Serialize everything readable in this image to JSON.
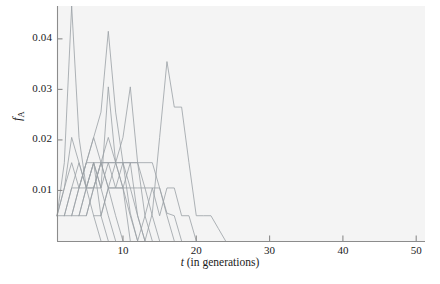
{
  "figure": {
    "width": 440,
    "height": 284,
    "background": "#ffffff",
    "panel_background": "#f4f4f4",
    "line_color": "#9aa0a6"
  },
  "chart_data": {
    "type": "line",
    "title": "",
    "xlabel": "t (in generations)",
    "xlabel_italic_part": "t",
    "xlabel_rest": " (in generations)",
    "ylabel": "f_A",
    "ylabel_base": "f",
    "ylabel_sub": "A",
    "xlim": [
      1,
      51.2
    ],
    "ylim": [
      0,
      0.0465
    ],
    "grid": false,
    "legend": null,
    "xticks": [
      10,
      20,
      30,
      40,
      50
    ],
    "xticklabels": [
      "10",
      "20",
      "30",
      "40",
      "50"
    ],
    "yticks": [
      0.01,
      0.02,
      0.03,
      0.04
    ],
    "yticklabels": [
      "0.01",
      "0.02",
      "0.03",
      "0.04"
    ],
    "series": [
      {
        "name": "replicate-1",
        "x": [
          1,
          2,
          3,
          4,
          5,
          6,
          7,
          8
        ],
        "values": [
          0.005,
          0.0155,
          0.0465,
          0.0205,
          0.0105,
          0.0155,
          0.005,
          0.0
        ]
      },
      {
        "name": "replicate-2",
        "x": [
          1,
          2,
          3,
          4,
          5,
          6,
          7
        ],
        "values": [
          0.005,
          0.0105,
          0.0205,
          0.0155,
          0.0105,
          0.005,
          0.0
        ]
      },
      {
        "name": "replicate-3",
        "x": [
          1,
          2,
          3,
          4,
          5,
          6,
          7,
          8,
          9
        ],
        "values": [
          0.005,
          0.005,
          0.0105,
          0.0155,
          0.0105,
          0.0155,
          0.0105,
          0.005,
          0.0
        ]
      },
      {
        "name": "replicate-4",
        "x": [
          1,
          2,
          3,
          4,
          5,
          6,
          7,
          8,
          9,
          10
        ],
        "values": [
          0.005,
          0.0105,
          0.0155,
          0.0105,
          0.0155,
          0.0205,
          0.0155,
          0.0105,
          0.005,
          0.0
        ]
      },
      {
        "name": "replicate-5",
        "x": [
          2,
          3,
          4,
          5,
          6,
          7,
          8,
          9,
          10,
          11
        ],
        "values": [
          0.005,
          0.005,
          0.0105,
          0.0105,
          0.0155,
          0.0105,
          0.0305,
          0.0155,
          0.0105,
          0.0
        ]
      },
      {
        "name": "replicate-6",
        "x": [
          2,
          3,
          4,
          5,
          6,
          7,
          8,
          9,
          10,
          11,
          12
        ],
        "values": [
          0.005,
          0.0105,
          0.0105,
          0.0155,
          0.0155,
          0.0155,
          0.0155,
          0.0155,
          0.0105,
          0.005,
          0.0
        ]
      },
      {
        "name": "replicate-7",
        "x": [
          3,
          4,
          5,
          6,
          7,
          8,
          9,
          10,
          11,
          12
        ],
        "values": [
          0.005,
          0.0105,
          0.0155,
          0.0205,
          0.0255,
          0.0415,
          0.0255,
          0.0155,
          0.0055,
          0.0
        ]
      },
      {
        "name": "replicate-8",
        "x": [
          3,
          4,
          5,
          6,
          7,
          8,
          9,
          10,
          11,
          12,
          13
        ],
        "values": [
          0.005,
          0.005,
          0.0105,
          0.0105,
          0.0155,
          0.0205,
          0.0155,
          0.0155,
          0.0105,
          0.005,
          0.0
        ]
      },
      {
        "name": "replicate-9",
        "x": [
          4,
          5,
          6,
          7,
          8,
          9,
          10,
          11,
          12,
          13
        ],
        "values": [
          0.005,
          0.0105,
          0.0105,
          0.0155,
          0.0155,
          0.0105,
          0.0105,
          0.0155,
          0.005,
          0.0
        ]
      },
      {
        "name": "replicate-10",
        "x": [
          4,
          5,
          6,
          7,
          8,
          9,
          10,
          11,
          12,
          13,
          14
        ],
        "values": [
          0.005,
          0.005,
          0.0105,
          0.0155,
          0.0105,
          0.0155,
          0.0205,
          0.0305,
          0.0155,
          0.005,
          0.0
        ]
      },
      {
        "name": "replicate-11",
        "x": [
          5,
          6,
          7,
          8,
          9,
          10,
          11,
          12,
          13,
          14,
          15
        ],
        "values": [
          0.005,
          0.0105,
          0.0105,
          0.0155,
          0.0155,
          0.0155,
          0.0155,
          0.0155,
          0.0105,
          0.005,
          0.0
        ]
      },
      {
        "name": "replicate-12",
        "x": [
          6,
          7,
          8,
          9,
          10,
          11,
          12,
          13,
          14,
          15,
          16,
          17
        ],
        "values": [
          0.005,
          0.005,
          0.0105,
          0.0105,
          0.0105,
          0.0105,
          0.0105,
          0.0105,
          0.0105,
          0.0105,
          0.005,
          0.0
        ]
      },
      {
        "name": "replicate-13",
        "x": [
          7,
          8,
          9,
          10,
          11,
          12,
          13,
          14,
          15,
          16,
          17,
          18
        ],
        "values": [
          0.005,
          0.0105,
          0.0105,
          0.0155,
          0.0155,
          0.0155,
          0.0155,
          0.0155,
          0.0105,
          0.0055,
          0.005,
          0.0
        ]
      },
      {
        "name": "replicate-14",
        "x": [
          12,
          13,
          14,
          15,
          16,
          17,
          18,
          19,
          20
        ],
        "values": [
          0.0,
          0.005,
          0.0105,
          0.005,
          0.0105,
          0.0105,
          0.005,
          0.005,
          0.0
        ]
      },
      {
        "name": "replicate-15",
        "x": [
          13,
          14,
          15,
          16,
          17,
          18,
          19,
          20,
          21,
          22,
          23,
          24
        ],
        "values": [
          0.0,
          0.0055,
          0.0205,
          0.0355,
          0.0265,
          0.0265,
          0.0155,
          0.005,
          0.005,
          0.005,
          0.0025,
          0.0
        ]
      }
    ]
  },
  "axes": {
    "panel": {
      "left": 57,
      "top": 6,
      "width": 368,
      "height": 235
    },
    "y_tick_positions": {
      "0.04": 42,
      "0.03": 92,
      "0.02": 142,
      "0.01": 192
    },
    "x_tick_positions": {
      "10": 122,
      "20": 195,
      "30": 268,
      "40": 342,
      "50": 415
    }
  }
}
